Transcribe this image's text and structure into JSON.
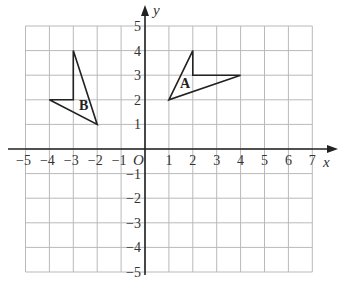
{
  "diagram": {
    "type": "coordinate-grid",
    "x_axis": {
      "label": "x",
      "min": -5,
      "max": 7,
      "ticks": [
        "-5",
        "-4",
        "-3",
        "-2",
        "-1",
        "1",
        "2",
        "3",
        "4",
        "5",
        "6",
        "7"
      ]
    },
    "y_axis": {
      "label": "y",
      "min": -5,
      "max": 5,
      "ticks": [
        "5",
        "4",
        "3",
        "2",
        "1",
        "-1",
        "-2",
        "-3",
        "-4",
        "-5"
      ]
    },
    "origin_label": "O",
    "shapes": [
      {
        "label": "A",
        "vertices": [
          [
            1,
            2
          ],
          [
            2,
            4
          ],
          [
            2,
            3
          ],
          [
            4,
            3
          ]
        ]
      },
      {
        "label": "B",
        "vertices": [
          [
            -3,
            4
          ],
          [
            -3,
            2
          ],
          [
            -4,
            2
          ],
          [
            -2,
            1
          ]
        ]
      }
    ]
  }
}
